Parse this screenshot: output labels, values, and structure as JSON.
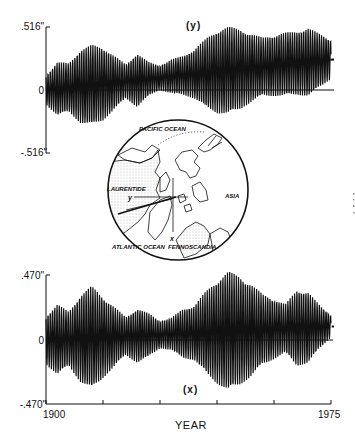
{
  "chart_data": [
    {
      "type": "line",
      "panel": "top",
      "title": "(y)",
      "xlabel": "",
      "ylabel": "",
      "y_tick_labels": [
        ".516\"",
        "0",
        "-.516\""
      ],
      "ylim": [
        -0.516,
        0.516
      ],
      "xlim": [
        1900,
        1975
      ],
      "grid": false,
      "series": [
        {
          "name": "y polar motion (oscillating)",
          "description": "Chandler wobble beat envelope with amplitude modulation ~6-7 yr; mean drifts upward",
          "x": [
            1900,
            1903,
            1906,
            1909,
            1912,
            1915,
            1918,
            1921,
            1924,
            1927,
            1930,
            1933,
            1936,
            1939,
            1942,
            1945,
            1948,
            1951,
            1954,
            1957,
            1960,
            1963,
            1966,
            1969,
            1972,
            1975
          ],
          "envelope": [
            0.12,
            0.22,
            0.2,
            0.3,
            0.33,
            0.3,
            0.22,
            0.14,
            0.22,
            0.14,
            0.1,
            0.14,
            0.16,
            0.2,
            0.28,
            0.34,
            0.36,
            0.33,
            0.28,
            0.24,
            0.25,
            0.26,
            0.26,
            0.28,
            0.22,
            0.16
          ]
        },
        {
          "name": "y mean trend",
          "x": [
            1900,
            1975
          ],
          "values": [
            0.0,
            0.25
          ]
        }
      ]
    },
    {
      "type": "line",
      "panel": "bottom",
      "title": "(x)",
      "xlabel": "YEAR",
      "ylabel": "",
      "y_tick_labels": [
        ".470\"",
        "0",
        "-.470\""
      ],
      "ylim": [
        -0.47,
        0.47
      ],
      "xlim": [
        1900,
        1975
      ],
      "x_tick_labels": [
        "1900",
        "1975"
      ],
      "x_ticks": [
        1900,
        1915,
        1930,
        1945,
        1960,
        1975
      ],
      "grid": false,
      "series": [
        {
          "name": "x polar motion (oscillating)",
          "x": [
            1900,
            1903,
            1906,
            1909,
            1912,
            1915,
            1918,
            1921,
            1924,
            1927,
            1930,
            1933,
            1936,
            1939,
            1942,
            1945,
            1948,
            1951,
            1954,
            1957,
            1960,
            1963,
            1966,
            1969,
            1972,
            1975
          ],
          "envelope": [
            0.18,
            0.26,
            0.2,
            0.32,
            0.38,
            0.3,
            0.22,
            0.14,
            0.2,
            0.16,
            0.1,
            0.12,
            0.18,
            0.2,
            0.3,
            0.38,
            0.44,
            0.4,
            0.34,
            0.26,
            0.22,
            0.18,
            0.28,
            0.26,
            0.16,
            0.08
          ]
        },
        {
          "name": "x mean trend",
          "x": [
            1900,
            1975
          ],
          "values": [
            0.0,
            0.1
          ]
        }
      ]
    }
  ],
  "map": {
    "labels": {
      "pacific": "PACIFIC OCEAN",
      "asia": "ASIA",
      "laurentide": "LAURENTIDE",
      "atlantic": "ATLANTIC OCEAN",
      "fennoscandia": "FENNOSCANDIA",
      "y_axis": "y",
      "x_axis": "x"
    }
  },
  "labels": {
    "top_panel": "(y)",
    "bottom_panel": "(x)",
    "top_ymax": ".516\"",
    "top_zero": "0",
    "top_ymin": "-.516\"",
    "bot_ymax": ".470\"",
    "bot_zero": "0",
    "bot_ymin": "-.470\"",
    "year_start": "1900",
    "year_end": "1975",
    "x_title": "YEAR"
  },
  "colors": {
    "ink": "#111111",
    "background": "#ffffff",
    "stipple": "#9a9a9a"
  }
}
